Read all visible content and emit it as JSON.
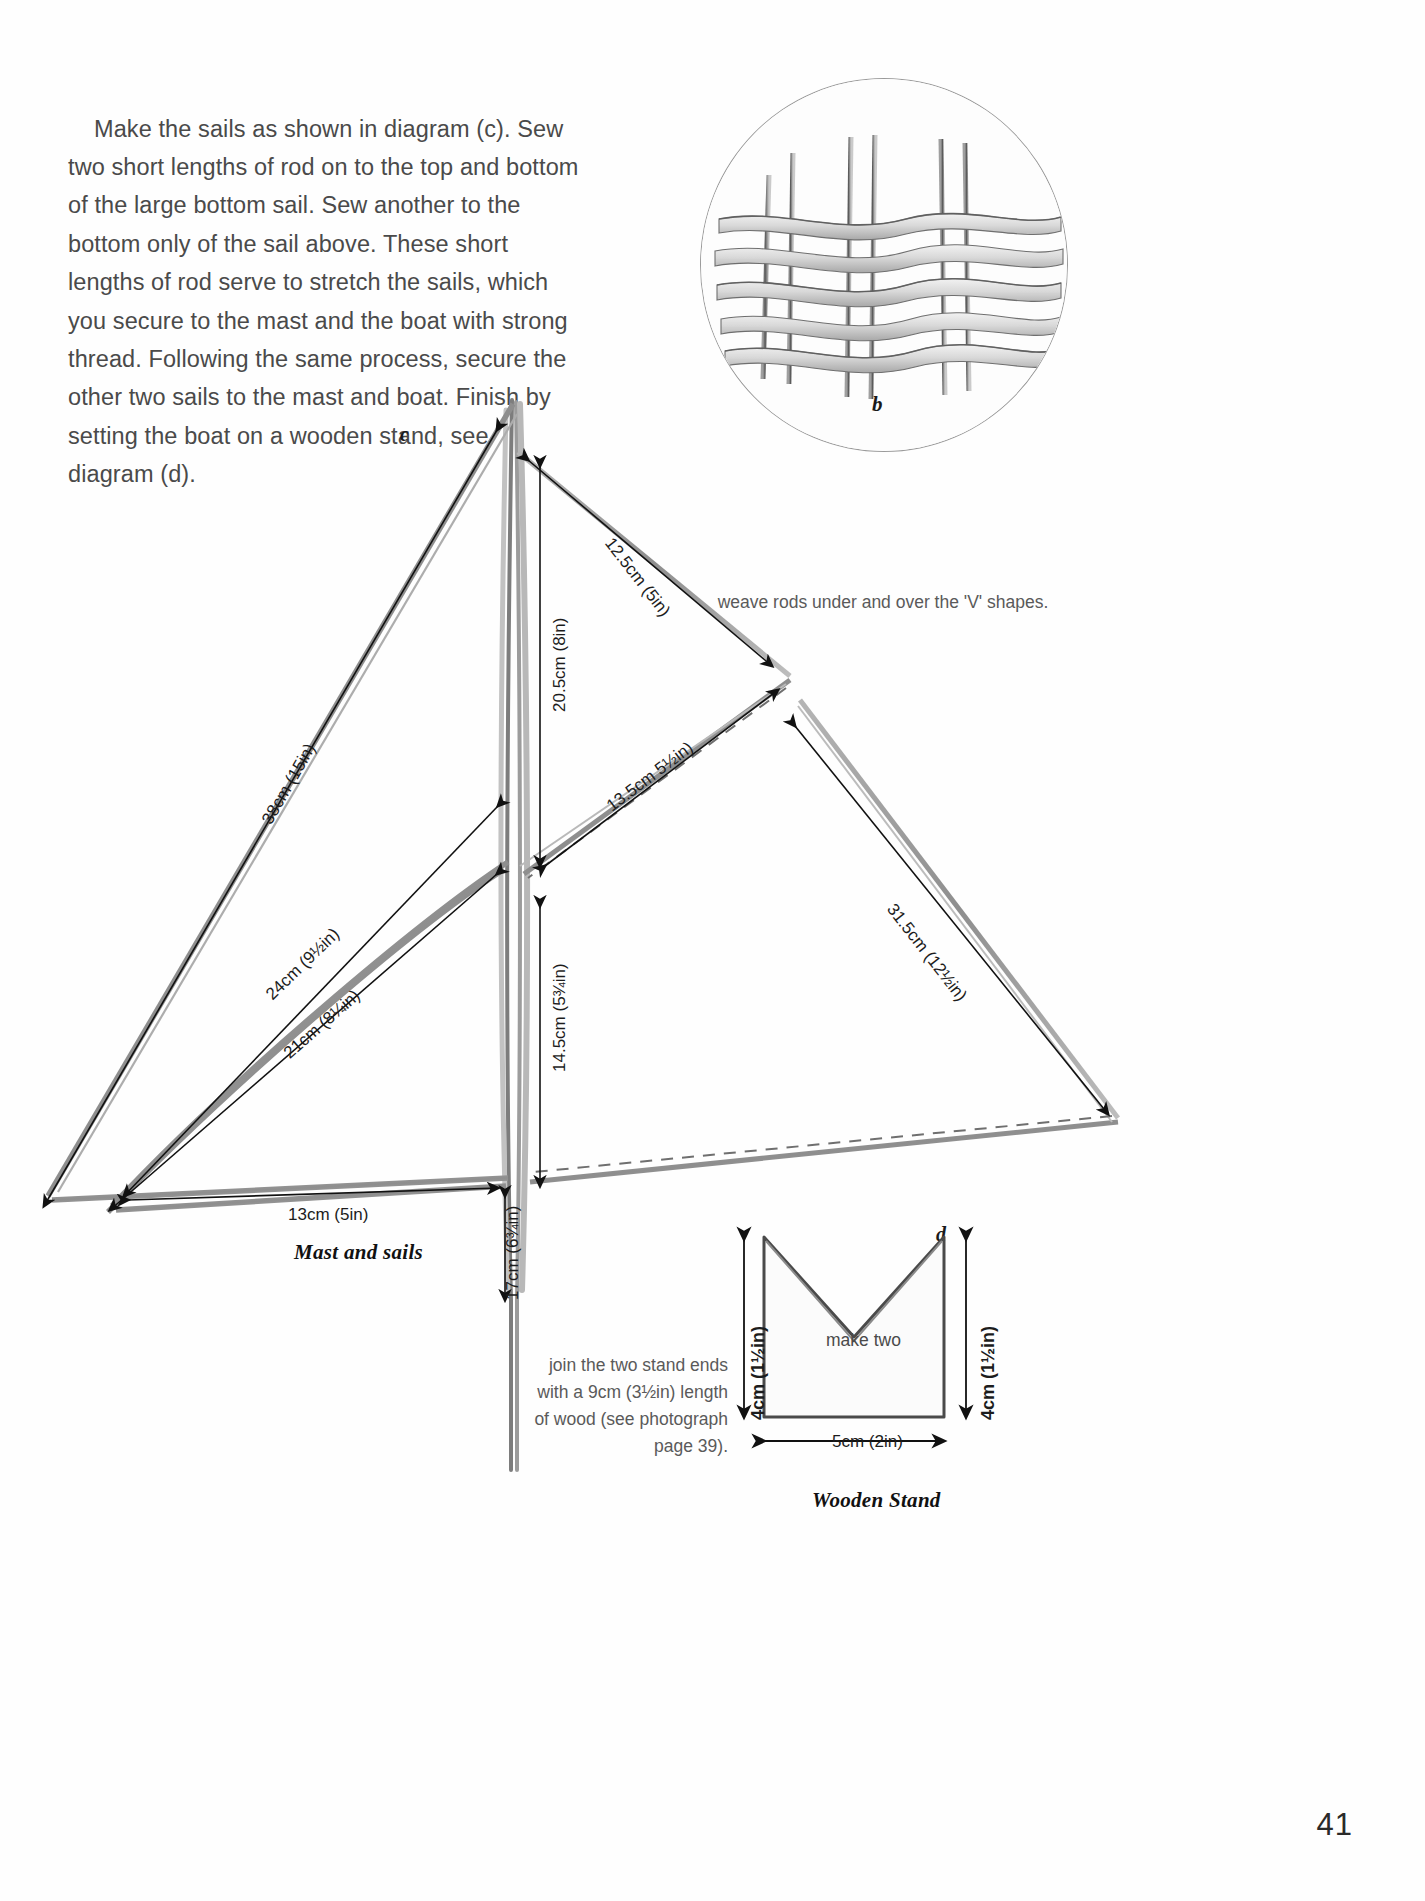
{
  "page": {
    "number": "41",
    "body_text": "Make the sails as shown in diagram (c). Sew two short lengths of rod on to the top and bottom of the large bottom sail. Sew another to the bottom only of the sail above. These short lengths of rod serve to stretch the sails, which you secure to the mast and the boat with strong thread. Following the same process, secure the other two sails to the mast and boat. Finish by setting the boat on a wooden stand, see diagram (d)."
  },
  "photo_b": {
    "label": "b",
    "caption": "weave rods under and over the 'V' shapes."
  },
  "sail_diagram": {
    "label": "c",
    "title": "Mast and sails",
    "dimensions": {
      "top_leech": "12.5cm (5in)",
      "mast_upper": "20.5cm (8in)",
      "middle_leech": "13.5cm 5½in)",
      "lower_leech": "31.5cm (12½in)",
      "upper_luff": "38cm (15in)",
      "mid_luff_a": "24cm (9½in)",
      "mid_luff_b": "21cm (8¼in)",
      "mast_lower": "14.5cm (5¾in)",
      "foot": "13cm (5in)",
      "mast_base": "17cm (6¾in)"
    }
  },
  "stand_diagram": {
    "label": "d",
    "title": "Wooden Stand",
    "make_two": "make two",
    "height": "4cm (1½in)",
    "width": "5cm (2in)",
    "note": "join the two stand ends with a 9cm (3½in) length of wood (see photograph page 39)."
  },
  "colors": {
    "ink": "#1c1c1c",
    "body": "#4a4a4a",
    "pencil": "#8d8d8d",
    "paper": "#fefefe"
  }
}
